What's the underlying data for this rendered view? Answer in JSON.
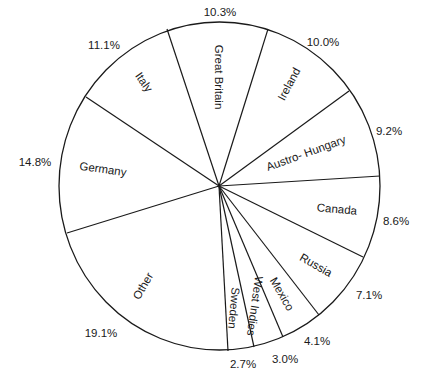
{
  "chart_data": {
    "type": "pie",
    "title": "",
    "categories": [
      "Great Britain",
      "Ireland",
      "Austro- Hungary",
      "Canada",
      "Russia",
      "Mexico",
      "West Indies",
      "Sweden",
      "Other",
      "Germany",
      "Italy"
    ],
    "values": [
      10.3,
      10.0,
      9.2,
      8.6,
      7.1,
      4.1,
      3.0,
      2.7,
      19.1,
      14.8,
      11.1
    ],
    "value_labels": [
      "10.3%",
      "10.0%",
      "9.2%",
      "8.6%",
      "7.1%",
      "4.1%",
      "3.0%",
      "2.7%",
      "19.1%",
      "14.8%",
      "11.1%"
    ],
    "units": "%",
    "legend": "none (labels drawn inside slices, percentages outside rim)",
    "colors": {
      "stroke": "#1a1a1a",
      "fill": "#ffffff"
    }
  }
}
